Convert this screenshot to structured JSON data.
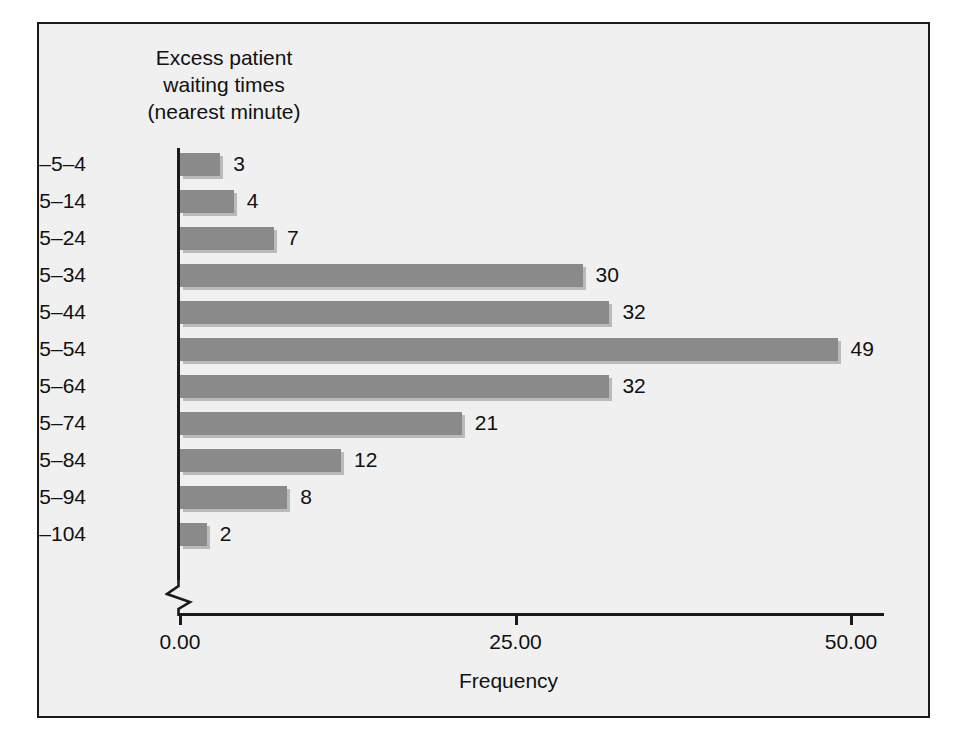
{
  "figure": {
    "title_lines": [
      "Excess patient",
      "waiting times",
      "(nearest minute)"
    ],
    "background_color": "#f0f0f0",
    "border_color": "#1a1a1a",
    "bar_color": "#8a8a8a"
  },
  "chart_data": {
    "type": "bar",
    "orientation": "horizontal",
    "title": "Excess patient waiting times (nearest minute)",
    "xlabel": "Frequency",
    "ylabel": "Excess patient waiting times (nearest minute)",
    "categories": [
      "–5–4",
      "5–14",
      "15–24",
      "25–34",
      "35–44",
      "45–54",
      "55–64",
      "65–74",
      "75–84",
      "85–94",
      "95–104"
    ],
    "values": [
      3,
      4,
      7,
      30,
      32,
      49,
      32,
      21,
      12,
      8,
      2
    ],
    "data_labels": [
      "3",
      "4",
      "7",
      "30",
      "32",
      "49",
      "32",
      "21",
      "12",
      "8",
      "2"
    ],
    "xlim": [
      0,
      52.5
    ],
    "xticks": [
      0,
      25,
      50
    ],
    "xtick_labels": [
      "0.00",
      "25.00",
      "50.00"
    ],
    "grid": false,
    "legend": false,
    "axis_break": true,
    "total_frequency": 200
  }
}
